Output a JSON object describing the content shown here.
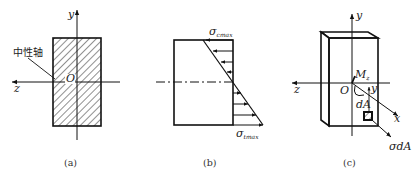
{
  "figure": {
    "panels": [
      {
        "id": "a",
        "caption": "(a)",
        "axis_y_label": "y",
        "axis_z_label": "z",
        "origin_label": "O",
        "neutral_axis_label": "中性轴",
        "shape": "hatched rectangular cross-section"
      },
      {
        "id": "b",
        "caption": "(b)",
        "stress_top_label": "σ",
        "stress_top_sub": "cmax",
        "stress_bottom_label": "σ",
        "stress_bottom_sub": "tmax",
        "shape": "linear bending stress distribution"
      },
      {
        "id": "c",
        "caption": "(c)",
        "axis_y_label": "y",
        "axis_z_label": "z",
        "axis_x_label": "x",
        "origin_label": "O",
        "moment_label": "M",
        "moment_sub": "z",
        "y_distance_label": "y",
        "area_element_label": "dA",
        "force_label": "σdA",
        "shape": "3D beam segment with area element"
      }
    ],
    "colors": {
      "line": "#111111",
      "background": "#ffffff"
    }
  }
}
